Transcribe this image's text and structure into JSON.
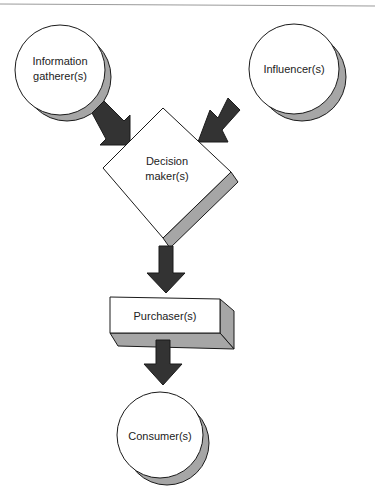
{
  "diagram": {
    "type": "flow",
    "colors": {
      "arrow": "#333333",
      "shadow": "#a6a6a6",
      "outline": "#1a1a1a",
      "fill": "#ffffff",
      "rule": "#999999"
    },
    "nodes": [
      {
        "id": "info",
        "shape": "circle",
        "line1": "Information",
        "line2": "gatherer(s)"
      },
      {
        "id": "influencer",
        "shape": "circle",
        "line1": "Influencer(s)"
      },
      {
        "id": "decision",
        "shape": "diamond",
        "line1": "Decision",
        "line2": "maker(s)"
      },
      {
        "id": "purchaser",
        "shape": "box",
        "line1": "Purchaser(s)"
      },
      {
        "id": "consumer",
        "shape": "circle",
        "line1": "Consumer(s)"
      }
    ],
    "edges": [
      {
        "from": "info",
        "to": "decision"
      },
      {
        "from": "influencer",
        "to": "decision"
      },
      {
        "from": "decision",
        "to": "purchaser"
      },
      {
        "from": "purchaser",
        "to": "consumer"
      }
    ]
  }
}
